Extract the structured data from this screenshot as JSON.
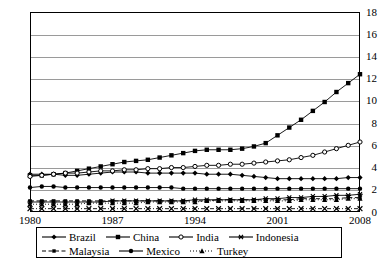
{
  "chart_data": {
    "type": "line",
    "title": "",
    "xlabel": "",
    "ylabel": "",
    "xlim": [
      1980,
      2008
    ],
    "ylim": [
      0,
      18
    ],
    "ytick_step": 2,
    "grid": true,
    "legend_position": "bottom",
    "x": [
      1980,
      1981,
      1982,
      1983,
      1984,
      1985,
      1986,
      1987,
      1988,
      1989,
      1990,
      1991,
      1992,
      1993,
      1994,
      1995,
      1996,
      1997,
      1998,
      1999,
      2000,
      2001,
      2002,
      2003,
      2004,
      2005,
      2006,
      2007,
      2008
    ],
    "ytick_labels": [
      "0",
      "2",
      "4",
      "6",
      "8",
      "10",
      "12",
      "14",
      "16",
      "18"
    ],
    "xtick_labels": [
      "1980",
      "1987",
      "1994",
      "2001",
      "2008"
    ],
    "xticks": [
      1980,
      1987,
      1994,
      2001,
      2008
    ],
    "series": [
      {
        "name": "Brazil",
        "marker": "diamond",
        "dash": "solid",
        "color": "#000000",
        "values": [
          3.4,
          3.4,
          3.4,
          3.3,
          3.3,
          3.4,
          3.5,
          3.6,
          3.6,
          3.6,
          3.5,
          3.5,
          3.5,
          3.5,
          3.5,
          3.4,
          3.4,
          3.4,
          3.3,
          3.2,
          3.1,
          3.0,
          3.0,
          3.0,
          3.0,
          3.0,
          3.0,
          3.1,
          3.1
        ]
      },
      {
        "name": "China",
        "marker": "square",
        "dash": "solid",
        "color": "#000000",
        "values": [
          3.3,
          3.3,
          3.4,
          3.5,
          3.7,
          3.9,
          4.1,
          4.3,
          4.5,
          4.6,
          4.7,
          4.9,
          5.1,
          5.3,
          5.5,
          5.6,
          5.6,
          5.6,
          5.7,
          5.9,
          6.2,
          6.9,
          7.6,
          8.3,
          9.1,
          9.9,
          10.8,
          11.6,
          12.4
        ]
      },
      {
        "name": "India",
        "marker": "circle-open",
        "dash": "solid",
        "color": "#000000",
        "values": [
          3.2,
          3.3,
          3.4,
          3.5,
          3.5,
          3.6,
          3.7,
          3.7,
          3.8,
          3.8,
          3.9,
          3.9,
          4.0,
          4.0,
          4.1,
          4.2,
          4.2,
          4.3,
          4.3,
          4.4,
          4.5,
          4.6,
          4.7,
          4.9,
          5.1,
          5.4,
          5.7,
          6.0,
          6.3
        ]
      },
      {
        "name": "Indonesia",
        "marker": "star",
        "dash": "solid",
        "color": "#000000",
        "values": [
          0.9,
          0.9,
          0.9,
          0.9,
          0.9,
          0.9,
          0.9,
          1.0,
          1.0,
          1.0,
          1.0,
          1.0,
          1.0,
          1.0,
          1.1,
          1.1,
          1.1,
          1.1,
          1.1,
          1.1,
          1.2,
          1.2,
          1.3,
          1.3,
          1.4,
          1.4,
          1.5,
          1.5,
          1.6
        ]
      },
      {
        "name": "Malaysia",
        "marker": "square-small",
        "dash": "dashed",
        "color": "#000000",
        "values": [
          1.0,
          1.0,
          1.0,
          1.0,
          1.0,
          1.0,
          1.0,
          1.0,
          1.0,
          1.0,
          1.0,
          1.0,
          1.0,
          1.0,
          1.0,
          1.0,
          1.1,
          1.1,
          1.1,
          1.1,
          1.1,
          1.1,
          1.1,
          1.2,
          1.2,
          1.2,
          1.2,
          1.3,
          1.3
        ]
      },
      {
        "name": "Mexico",
        "marker": "circle",
        "dash": "solid",
        "color": "#000000",
        "values": [
          2.2,
          2.3,
          2.3,
          2.2,
          2.2,
          2.2,
          2.2,
          2.2,
          2.2,
          2.2,
          2.2,
          2.2,
          2.2,
          2.1,
          2.1,
          2.1,
          2.1,
          2.1,
          2.1,
          2.1,
          2.1,
          2.1,
          2.1,
          2.1,
          2.1,
          2.1,
          2.1,
          2.1,
          2.1
        ]
      },
      {
        "name": "Turkey",
        "marker": "triangle",
        "dash": "dotted",
        "color": "#000000",
        "values": [
          0.7,
          0.7,
          0.7,
          0.7,
          0.7,
          0.8,
          0.8,
          0.8,
          0.8,
          0.8,
          0.9,
          0.9,
          0.9,
          0.9,
          0.9,
          1.0,
          1.0,
          1.0,
          1.0,
          1.0,
          1.0,
          1.0,
          1.0,
          1.1,
          1.1,
          1.1,
          1.1,
          1.2,
          1.2
        ]
      },
      {
        "name": "Other",
        "marker": "cross",
        "dash": "dashdot",
        "color": "#000000",
        "values": [
          0.3,
          0.3,
          0.3,
          0.3,
          0.3,
          0.3,
          0.3,
          0.3,
          0.3,
          0.3,
          0.3,
          0.3,
          0.3,
          0.3,
          0.3,
          0.3,
          0.3,
          0.3,
          0.3,
          0.3,
          0.3,
          0.3,
          0.3,
          0.3,
          0.3,
          0.3,
          0.3,
          0.3,
          0.3
        ]
      }
    ]
  },
  "legend": {
    "row1": [
      {
        "label": "Brazil",
        "marker": "diamond",
        "dash": "solid"
      },
      {
        "label": "China",
        "marker": "square",
        "dash": "solid"
      },
      {
        "label": "India",
        "marker": "circle-open",
        "dash": "solid"
      },
      {
        "label": "Indonesia",
        "marker": "star",
        "dash": "solid"
      }
    ],
    "row2": [
      {
        "label": "Malaysia",
        "marker": "square-small",
        "dash": "dashed"
      },
      {
        "label": "Mexico",
        "marker": "circle",
        "dash": "solid"
      },
      {
        "label": "Turkey",
        "marker": "triangle",
        "dash": "dotted"
      }
    ]
  }
}
